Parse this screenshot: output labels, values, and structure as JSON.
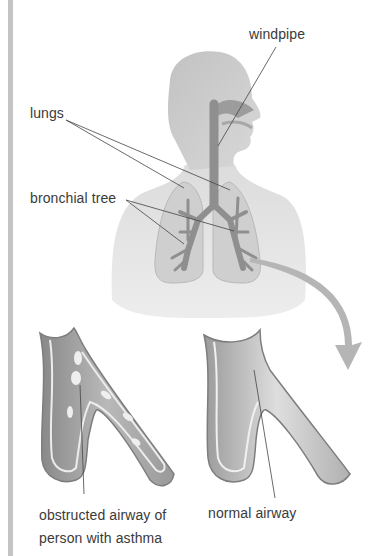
{
  "figure": {
    "type": "anatomical-diagram"
  },
  "labels": {
    "windpipe": "windpipe",
    "lungs": "lungs",
    "bronchial_tree": "bronchial tree",
    "obstructed_line1": "obstructed airway of",
    "obstructed_line2": "person with asthma",
    "normal": "normal airway"
  },
  "colors": {
    "body": "#e0e0e0",
    "head": "#cdcdcd",
    "airway": "#8f8f8f",
    "lung": "#cfcfcf",
    "arrow": "#b5b5b5",
    "text": "#3a3a3a",
    "leader": "#444444",
    "side_bar": "#c4c4c4"
  }
}
